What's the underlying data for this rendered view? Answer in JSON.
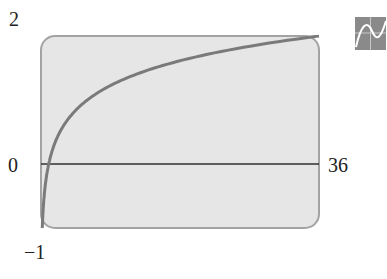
{
  "chart_data": {
    "type": "line",
    "title": "",
    "function": "y = log_6(x)",
    "xlabel": "",
    "ylabel": "",
    "xlim": [
      0,
      36
    ],
    "ylim": [
      -1,
      2
    ],
    "grid": false,
    "legend": null,
    "tick_labels": {
      "y_top": "2",
      "y_bottom": "−1",
      "x_left": "0",
      "x_right": "36"
    },
    "series": [
      {
        "name": "curve",
        "x": [
          0.167,
          0.5,
          1,
          2,
          4,
          6,
          9,
          12,
          16,
          20,
          25,
          30,
          36
        ],
        "values": [
          -1,
          -0.387,
          0,
          0.387,
          0.774,
          1,
          1.226,
          1.387,
          1.547,
          1.672,
          1.797,
          1.898,
          2
        ]
      }
    ],
    "colors": {
      "panel": "#e4e4e4",
      "border": "#9a9a9a",
      "curve": "#777777",
      "axis": "#333333"
    }
  },
  "labels": {
    "y_top": "2",
    "y_zero": "0",
    "y_bottom": "−1",
    "x_right": "36"
  },
  "icon": "graph-icon"
}
